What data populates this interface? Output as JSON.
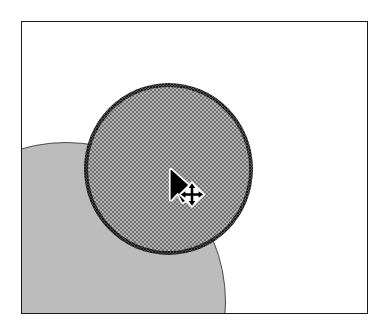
{
  "app": {
    "view_name": "drawing-canvas",
    "background_color": "#ffffff"
  },
  "canvas": {
    "frame": {
      "x": 21,
      "y": 21,
      "width": 347,
      "height": 293,
      "border_color": "#1a1a1a",
      "fill_color": "#ffffff"
    },
    "shapes": [
      {
        "id": "big-circle",
        "type": "circle",
        "label": "Large gray circle",
        "selected": false,
        "fill_color": "#bcbcbc",
        "outline_color": "#4a4a4a",
        "fill_style": "solid",
        "center_x": 44,
        "center_y": 280,
        "radius": 160,
        "clipped": "left, bottom"
      },
      {
        "id": "selected-circle",
        "type": "circle",
        "label": "Selected stippled circle",
        "selected": true,
        "fill_color": "#b4b4b4",
        "outline_color": "#1c1c1c",
        "fill_style": "halftone-stipple",
        "center_x": 167,
        "center_y": 168,
        "radius": 80,
        "selection_outline_width": 4.5
      }
    ]
  },
  "cursor": {
    "pointer_icon": "arrow-pointer-icon",
    "handle_icon": "move-four-way-arrow-icon",
    "tip_x": 150,
    "tip_y": 150,
    "handle_center_x": 185,
    "handle_center_y": 186,
    "pointer_fill": "#000000",
    "pointer_outline": "#ffffff",
    "handle_fill": "#ffffff",
    "handle_arrow_color": "#000000"
  }
}
